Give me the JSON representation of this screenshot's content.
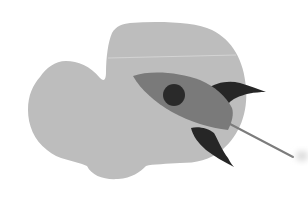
{
  "illustration": {
    "subject": "rocket",
    "background_shape": "blob",
    "colors": {
      "background": "#ffffff",
      "blob": "#bdbdbd",
      "blob_highlight": "#d6d6d6",
      "rocket_body": "#7a7a7a",
      "porthole": "#2b2b2b",
      "fins": "#272727",
      "trail": "#7c7c7c",
      "smudge": "#d9d9d9"
    }
  }
}
